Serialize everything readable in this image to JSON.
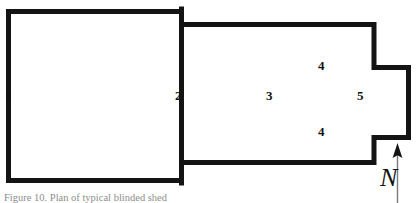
{
  "figure": {
    "type": "architectural-floor-plan",
    "caption": "Figure 10.  Plan of typical blinded shed",
    "wall_color": "#141414",
    "background_color": "#ffffff",
    "fill_color": "#ffffff"
  },
  "rooms": [
    {
      "id": "1",
      "label": "1"
    },
    {
      "id": "2",
      "label": "2"
    },
    {
      "id": "3",
      "label": "3"
    },
    {
      "id": "4a",
      "label": "4"
    },
    {
      "id": "4b",
      "label": "4"
    },
    {
      "id": "5",
      "label": "5"
    }
  ],
  "compass": {
    "label": "N",
    "direction": "north",
    "arrow_icon": "north-arrow-icon"
  }
}
